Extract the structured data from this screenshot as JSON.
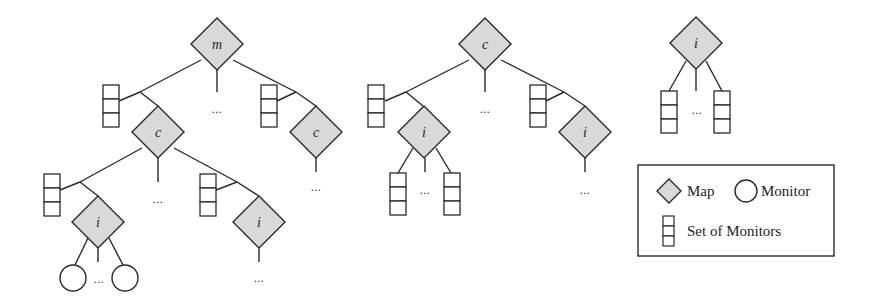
{
  "colors": {
    "stroke": "#2a2a2a",
    "map_fill": "#d9d9d9",
    "background": "#ffffff"
  },
  "trees": [
    {
      "id": "tree-1",
      "root": {
        "type": "map",
        "label": "m"
      },
      "children": [
        {
          "type": "map",
          "label": "c",
          "children_labels": [
            "i",
            "i"
          ]
        },
        {
          "type": "map",
          "label": "c"
        }
      ],
      "leaf_labels": [
        "i",
        "i"
      ]
    },
    {
      "id": "tree-2",
      "root": {
        "type": "map",
        "label": "c"
      },
      "children": [
        {
          "type": "map",
          "label": "i"
        },
        {
          "type": "map",
          "label": "i"
        }
      ]
    },
    {
      "id": "tree-3",
      "root": {
        "type": "map",
        "label": "i"
      }
    }
  ],
  "labels": {
    "t1_root": "m",
    "t1_c_left": "c",
    "t1_c_right": "c",
    "t1_i_left": "i",
    "t1_i_right": "i",
    "t2_root": "c",
    "t2_i_left": "i",
    "t2_i_right": "i",
    "t3_root": "i",
    "ellipsis": "..."
  },
  "legend": {
    "map_label": "Map",
    "monitor_label": "Monitor",
    "set_label": "Set of Monitors",
    "items": [
      {
        "icon": "diamond-icon",
        "label": "Map"
      },
      {
        "icon": "circle-icon",
        "label": "Monitor"
      },
      {
        "icon": "stacked-boxes-icon",
        "label": "Set of Monitors"
      }
    ]
  }
}
